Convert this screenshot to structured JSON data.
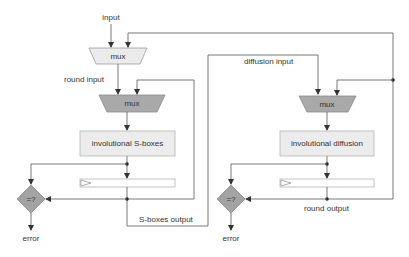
{
  "colors": {
    "wire": "#6a6a6a",
    "mux_light": "#ebebeb",
    "mux_dark": "#a9a9a9",
    "box_fill": "#ececec",
    "box_border": "#b5b5b5",
    "compare_fill": "#a3a3a3",
    "register_fill": "#ffffff"
  },
  "labels": {
    "input": "input",
    "round_input": "round input",
    "diffusion_input": "diffusion input",
    "sboxes_output": "S-boxes output",
    "round_output": "round output"
  },
  "left_stage": {
    "input_mux": {
      "label": "mux"
    },
    "mux": {
      "label": "mux"
    },
    "function_box": {
      "label": "involutional S-boxes"
    },
    "compare": {
      "label": "=?"
    },
    "error": {
      "label": "error"
    }
  },
  "right_stage": {
    "mux": {
      "label": "mux"
    },
    "function_box": {
      "label": "involutional diffusion"
    },
    "compare": {
      "label": "=?"
    },
    "error": {
      "label": "error"
    }
  }
}
